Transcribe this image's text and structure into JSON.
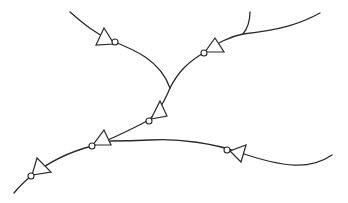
{
  "diagram": {
    "title": "",
    "stroke_color": "#2a2a2a",
    "background": "#ffffff",
    "wires": [
      {
        "id": "wire-top-left",
        "d": "M70,12 C85,25 95,33 110,40 C135,50 160,60 170,88"
      },
      {
        "id": "wire-top-right-short",
        "d": "M250,12 C250,22 247,29 243,34"
      },
      {
        "id": "wire-top-right-long",
        "d": "M320,13 C300,24 280,30 243,34 C228,37 218,43 205,52 C188,62 178,72 170,88"
      },
      {
        "id": "wire-trunk",
        "d": "M170,88 C165,100 160,110 149,120 C130,130 110,140 92,146 C65,153 45,165 31,176 C24,182 18,188 14,193"
      },
      {
        "id": "wire-right-lower",
        "d": "M332,155 C310,170 285,168 238,152 C215,144 180,138 150,140 C130,141 118,141 110,141"
      }
    ],
    "inverters": [
      {
        "id": "inv-1",
        "points": "96,29 108,44 114,40",
        "tri": "104,28 96,45 114,44",
        "bubble": {
          "cx": 115,
          "cy": 42,
          "r": 3
        }
      },
      {
        "id": "inv-2",
        "tri": "215,38 224,52 205,52",
        "bubble": {
          "cx": 204,
          "cy": 53,
          "r": 3
        }
      },
      {
        "id": "inv-3",
        "tri": "160,101 167,116 151,119",
        "bubble": {
          "cx": 149,
          "cy": 121,
          "r": 3
        }
      },
      {
        "id": "inv-4",
        "tri": "104,130 111,145 93,145",
        "bubble": {
          "cx": 92,
          "cy": 146,
          "r": 3
        }
      },
      {
        "id": "inv-5",
        "tri": "37,158 51,172 32,175",
        "bubble": {
          "cx": 31,
          "cy": 176,
          "r": 3
        }
      },
      {
        "id": "inv-6",
        "tri": "246,145 241,162 230,151",
        "bubble": {
          "cx": 227,
          "cy": 150,
          "r": 3
        }
      }
    ]
  }
}
